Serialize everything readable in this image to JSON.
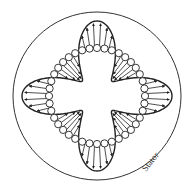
{
  "diagram": {
    "title": "",
    "labels": {
      "stator": "Stator"
    },
    "geometry": {
      "center": [
        97,
        96
      ],
      "stator_radius": 84,
      "ring_radius": 48,
      "conductor_radius": 3.6,
      "conductor_count": 40,
      "lobe_amplitude": 27,
      "poles": 4
    },
    "flux": {
      "outward_lobes": [
        "top",
        "right",
        "bottom",
        "left"
      ],
      "inward_lobes": [
        "top-right",
        "bottom-right",
        "bottom-left",
        "top-left"
      ]
    },
    "colors": {
      "stroke": "#222222",
      "background": "#ffffff",
      "text": "#333333"
    }
  }
}
